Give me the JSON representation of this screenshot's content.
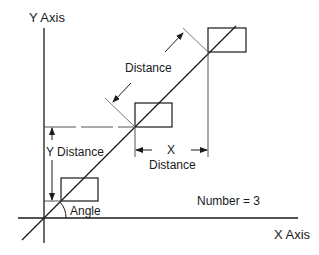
{
  "diagram": {
    "type": "geometry-layout",
    "labels": {
      "y_axis": "Y Axis",
      "x_axis": "X Axis",
      "distance": "Distance",
      "y_distance": "Y Distance",
      "x_distance_line1": "X",
      "x_distance_line2": "Distance",
      "angle": "Angle",
      "number": "Number = 3"
    },
    "number_of_items": 3,
    "colors": {
      "line": "#1a1a1a",
      "light_line": "#7a7a7a",
      "background": "#ffffff"
    }
  }
}
